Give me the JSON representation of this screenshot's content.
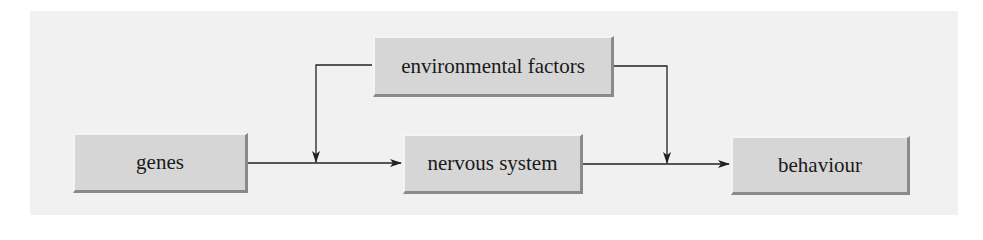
{
  "diagram": {
    "nodes": [
      {
        "id": "genes",
        "label": "genes"
      },
      {
        "id": "environmental_factors",
        "label": "environmental factors"
      },
      {
        "id": "nervous_system",
        "label": "nervous system"
      },
      {
        "id": "behaviour",
        "label": "behaviour"
      }
    ],
    "edges": [
      {
        "from": "genes",
        "to": "nervous_system"
      },
      {
        "from": "nervous_system",
        "to": "behaviour"
      },
      {
        "from": "environmental_factors",
        "to": "genes->nervous_system"
      },
      {
        "from": "environmental_factors",
        "to": "nervous_system->behaviour"
      }
    ],
    "colors": {
      "background": "#f1f1f1",
      "box_fill": "#d6d6d6",
      "box_shadow": "#8a8a8a",
      "line": "#222222"
    }
  }
}
